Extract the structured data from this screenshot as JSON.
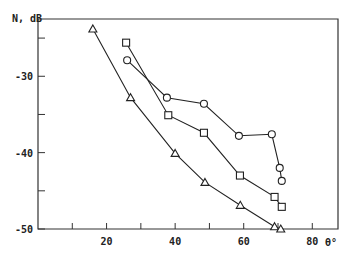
{
  "chart_data": {
    "type": "line",
    "title": "",
    "ylabel": "N, dB",
    "xlabel": "θ°",
    "xlim": [
      0,
      87.5
    ],
    "ylim": [
      -50,
      -22.5
    ],
    "xticks": [
      10,
      20,
      30,
      40,
      50,
      60,
      70,
      80
    ],
    "xtick_labels": [
      "",
      "20",
      "",
      "40",
      "",
      "60",
      "",
      "80"
    ],
    "yticks": [
      -50,
      -45,
      -40,
      -35,
      -30,
      -25
    ],
    "ytick_labels": [
      "-50",
      "",
      "-40",
      "",
      "-30",
      ""
    ],
    "grid": false,
    "legend": "none",
    "series": [
      {
        "name": "triangles",
        "marker": "triangle",
        "x": [
          16,
          27,
          40,
          48.7,
          59,
          69,
          70.8
        ],
        "y": [
          -23.8,
          -32.8,
          -40.1,
          -43.9,
          -46.9,
          -49.7,
          -50.0
        ]
      },
      {
        "name": "squares",
        "marker": "square",
        "x": [
          25.7,
          38,
          48.4,
          58.9,
          69,
          71.1
        ],
        "y": [
          -25.6,
          -35.1,
          -37.4,
          -43.0,
          -45.8,
          -47.1
        ]
      },
      {
        "name": "circles",
        "marker": "circle",
        "x": [
          26,
          37.6,
          48.4,
          58.6,
          68.2,
          70.5,
          71.1
        ],
        "y": [
          -27.9,
          -32.8,
          -33.6,
          -37.8,
          -37.6,
          -42.0,
          -43.7
        ]
      }
    ]
  }
}
